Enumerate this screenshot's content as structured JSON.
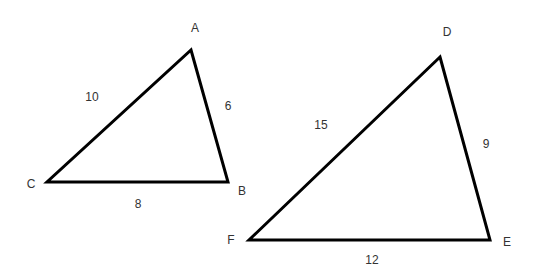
{
  "triangles": [
    {
      "name": "ABC",
      "vertices": {
        "A": [
          191,
          50
        ],
        "B": [
          228,
          182
        ],
        "C": [
          47,
          182
        ]
      },
      "vertex_labels": {
        "A": "A",
        "B": "B",
        "C": "C"
      },
      "sides": {
        "AC": "10",
        "AB": "6",
        "CB": "8"
      }
    },
    {
      "name": "DEF",
      "vertices": {
        "D": [
          440,
          57
        ],
        "E": [
          490,
          240
        ],
        "F": [
          249,
          240
        ]
      },
      "vertex_labels": {
        "D": "D",
        "E": "E",
        "F": "F"
      },
      "sides": {
        "DF": "15",
        "DE": "9",
        "FE": "12"
      }
    }
  ],
  "colors": {
    "stroke": "#000000",
    "text": "#333333"
  }
}
